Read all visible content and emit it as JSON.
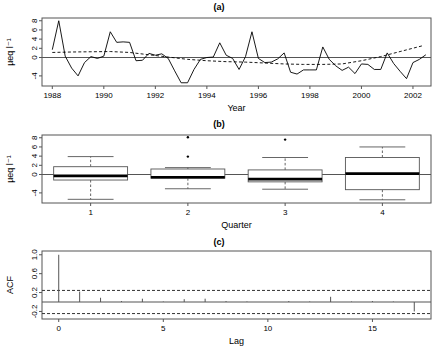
{
  "figure": {
    "panels": [
      {
        "id": "a",
        "title": "(a)"
      },
      {
        "id": "b",
        "title": "(b)"
      },
      {
        "id": "c",
        "title": "(c)"
      }
    ]
  },
  "chart_data": [
    {
      "type": "line",
      "panel": "(a)",
      "title": "(a)",
      "xlabel": "Year",
      "ylabel": "µeq l⁻¹",
      "xlim": [
        1987.6,
        2002.7
      ],
      "ylim": [
        -6.2,
        8.6
      ],
      "xticks": [
        1988,
        1990,
        1992,
        1994,
        1996,
        1998,
        2000,
        2002
      ],
      "xtick_labels": [
        "1988",
        "1990",
        "1992",
        "1994",
        "1996",
        "1998",
        "2000",
        "2002"
      ],
      "yticks": [
        -4,
        0,
        2,
        4,
        6,
        8
      ],
      "ytick_labels": [
        "-4",
        "0",
        "2",
        "4",
        "6",
        "8"
      ],
      "grid": false,
      "legend": "none",
      "reference_line_y": 0,
      "series": [
        {
          "name": "quarterly series",
          "style": "solid",
          "x": [
            1988.0,
            1988.25,
            1988.5,
            1988.75,
            1989.0,
            1989.25,
            1989.5,
            1989.75,
            1990.0,
            1990.25,
            1990.5,
            1990.75,
            1991.0,
            1991.25,
            1991.5,
            1991.75,
            1992.0,
            1992.25,
            1992.5,
            1992.75,
            1993.0,
            1993.25,
            1993.5,
            1993.75,
            1994.0,
            1994.25,
            1994.5,
            1994.75,
            1995.0,
            1995.25,
            1995.5,
            1995.75,
            1996.0,
            1996.25,
            1996.5,
            1996.75,
            1997.0,
            1997.25,
            1997.5,
            1997.75,
            1998.0,
            1998.25,
            1998.5,
            1998.75,
            1999.0,
            1999.25,
            1999.5,
            1999.75,
            2000.0,
            2000.25,
            2000.5,
            2000.75,
            2001.0,
            2001.25,
            2001.5,
            2001.75,
            2002.0,
            2002.25,
            2002.5
          ],
          "y": [
            1.7,
            8.0,
            0.3,
            -2.3,
            -4.0,
            -1.1,
            0.2,
            -0.2,
            0.3,
            5.6,
            3.3,
            3.4,
            3.3,
            -0.7,
            -0.6,
            0.9,
            0.5,
            0.8,
            -0.2,
            -2.9,
            -5.5,
            -5.5,
            -2.6,
            -0.4,
            0.0,
            0.1,
            3.2,
            0.5,
            -0.2,
            -2.6,
            0.2,
            5.6,
            -0.2,
            -1.1,
            -1.0,
            -0.3,
            1.0,
            -3.2,
            -3.6,
            -2.7,
            -2.7,
            -2.7,
            2.3,
            -0.4,
            -1.8,
            -2.8,
            -2.1,
            -3.5,
            -1.4,
            -1.5,
            -2.6,
            -2.6,
            1.0,
            -1.3,
            -3.0,
            -4.6,
            -1.1,
            -0.4,
            0.6,
            1.3,
            0.1,
            -1.8,
            3.2,
            0.4,
            -1.0,
            2.2,
            -0.6,
            2.2,
            -0.4,
            7.5,
            4.2,
            2.3,
            1.0
          ]
        },
        {
          "name": "smoothed trend",
          "style": "dashed",
          "x": [
            1988.0,
            1988.75,
            1989.5,
            1990.25,
            1991.0,
            1991.75,
            1992.5,
            1993.25,
            1994.0,
            1994.75,
            1995.5,
            1996.25,
            1997.0,
            1997.75,
            1998.5,
            1999.25,
            2000.0,
            2000.75,
            2001.5,
            2002.4
          ],
          "y": [
            1.1,
            1.2,
            1.25,
            1.3,
            1.1,
            0.6,
            0.1,
            -0.4,
            -0.7,
            -0.9,
            -1.0,
            -1.2,
            -1.4,
            -1.5,
            -1.5,
            -1.4,
            -0.7,
            0.2,
            1.3,
            2.6
          ]
        }
      ]
    },
    {
      "type": "box",
      "panel": "(b)",
      "title": "(b)",
      "xlabel": "Quarter",
      "ylabel": "µeq l⁻¹",
      "ylim": [
        -6.2,
        8.6
      ],
      "yticks": [
        -4,
        0,
        2,
        4,
        6,
        8
      ],
      "ytick_labels": [
        "-4",
        "0",
        "2",
        "4",
        "6",
        "8"
      ],
      "categories": [
        "1",
        "2",
        "3",
        "4"
      ],
      "grid": false,
      "legend": "none",
      "reference_line_y": 0,
      "boxes": [
        {
          "category": "1",
          "min": -5.4,
          "q1": -1.2,
          "median": -0.3,
          "q3": 1.7,
          "max": 3.9,
          "outliers": []
        },
        {
          "category": "2",
          "min": -3.1,
          "q1": -0.8,
          "median": -0.6,
          "q3": 1.2,
          "max": 1.5,
          "outliers": [
            8.1,
            3.9
          ]
        },
        {
          "category": "3",
          "min": -3.2,
          "q1": -1.6,
          "median": -1.0,
          "q3": 1.0,
          "max": 3.7,
          "outliers": [
            7.6
          ]
        },
        {
          "category": "4",
          "min": -5.5,
          "q1": -3.3,
          "median": 0.2,
          "q3": 3.7,
          "max": 6.0,
          "outliers": []
        }
      ]
    },
    {
      "type": "bar",
      "panel": "(c)",
      "title": "(c)",
      "xlabel": "Lag",
      "ylabel": "ACF",
      "xlim": [
        -0.8,
        17.8
      ],
      "ylim": [
        -0.36,
        1.08
      ],
      "xticks": [
        0,
        5,
        10,
        15
      ],
      "xtick_labels": [
        "0",
        "5",
        "10",
        "15"
      ],
      "yticks": [
        1.0,
        0.6,
        0.2,
        -0.2
      ],
      "ytick_labels": [
        "1.0",
        "0.6",
        "0.2",
        "-0.2"
      ],
      "grid": false,
      "legend": "none",
      "confidence_bounds": [
        0.245,
        -0.245
      ],
      "categories": [
        0,
        1,
        2,
        3,
        4,
        5,
        6,
        7,
        8,
        9,
        10,
        11,
        12,
        13,
        14,
        15,
        16,
        17
      ],
      "values": [
        1.0,
        0.22,
        0.09,
        0.02,
        0.07,
        0.01,
        0.06,
        0.07,
        0.02,
        0.01,
        0.0,
        0.02,
        0.01,
        0.11,
        0.01,
        0.02,
        0.01,
        -0.2
      ]
    }
  ]
}
